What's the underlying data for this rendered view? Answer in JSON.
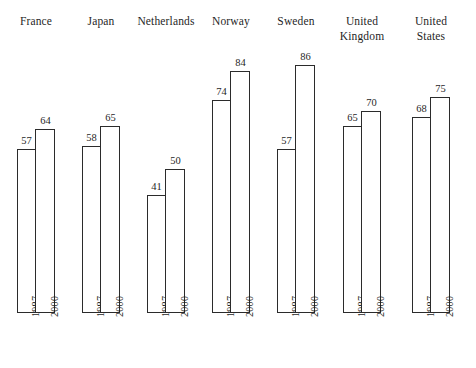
{
  "chart_data": {
    "type": "bar",
    "title": "",
    "subtitle": "",
    "xlabel": "",
    "ylabel": "",
    "grid": false,
    "legend_position": "none",
    "axis_visible": false,
    "ylim": [
      0,
      90
    ],
    "categories": [
      "France",
      "Japan",
      "Netherlands",
      "Norway",
      "Sweden",
      "United Kingdom",
      "United States"
    ],
    "series": [
      {
        "name": "1987",
        "values": [
          57,
          58,
          41,
          74,
          57,
          65,
          68
        ]
      },
      {
        "name": "2000",
        "values": [
          64,
          65,
          50,
          84,
          86,
          70,
          75
        ]
      }
    ],
    "groups": [
      {
        "country": "France",
        "label_lines": "France",
        "bars": [
          {
            "year": "1987",
            "value": 57
          },
          {
            "year": "2000",
            "value": 64
          }
        ]
      },
      {
        "country": "Japan",
        "label_lines": "Japan",
        "bars": [
          {
            "year": "1987",
            "value": 58
          },
          {
            "year": "2000",
            "value": 65
          }
        ]
      },
      {
        "country": "Netherlands",
        "label_lines": "Netherlands",
        "bars": [
          {
            "year": "1987",
            "value": 41
          },
          {
            "year": "2000",
            "value": 50
          }
        ]
      },
      {
        "country": "Norway",
        "label_lines": "Norway",
        "bars": [
          {
            "year": "1987",
            "value": 74
          },
          {
            "year": "2000",
            "value": 84
          }
        ]
      },
      {
        "country": "Sweden",
        "label_lines": "Sweden",
        "bars": [
          {
            "year": "1987",
            "value": 57
          },
          {
            "year": "2000",
            "value": 86
          }
        ]
      },
      {
        "country": "United Kingdom",
        "label_lines": "United\nKingdom",
        "bars": [
          {
            "year": "1987",
            "value": 65
          },
          {
            "year": "2000",
            "value": 70
          }
        ]
      },
      {
        "country": "United States",
        "label_lines": "United\nStates",
        "bars": [
          {
            "year": "1987",
            "value": 68
          },
          {
            "year": "2000",
            "value": 75
          }
        ]
      }
    ]
  },
  "colors": {
    "bar_outline": "#2b2b2b",
    "bar_fill": "#ffffff",
    "text": "#1f1f1f",
    "background": "#ffffff"
  },
  "layout": {
    "baseline_y": 313,
    "px_per_unit": 2.88,
    "bar_width": 19,
    "group_left_positions": [
      17,
      82,
      147,
      212,
      277,
      343,
      412
    ]
  }
}
